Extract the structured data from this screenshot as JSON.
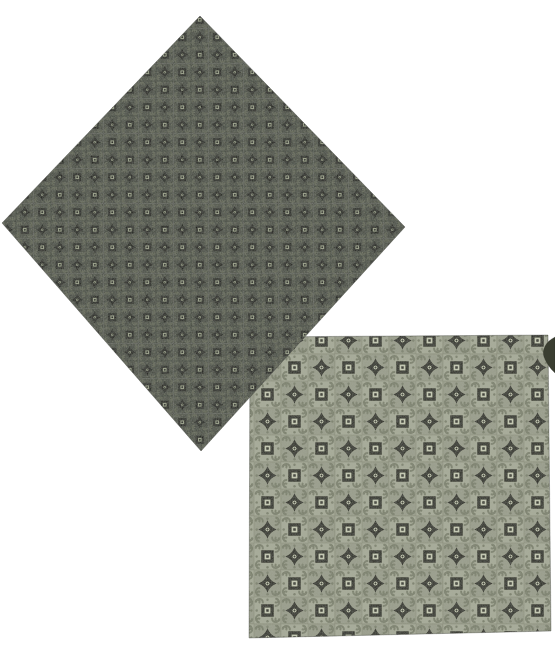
{
  "scene": {
    "description": "Photograph of two printed foulard quilting-fabric swatches on a plain white background",
    "background_color": "#ffffff",
    "motif_names": [
      "square-ring-motif",
      "four-point-star-motif",
      "corner-scroll-spirals",
      "tile-grid-lines"
    ]
  },
  "swatches": {
    "dark_diamond": {
      "label": "dark green foulard swatch rotated 45 degrees (diamond orientation), upper left",
      "shape": "diamond",
      "palette": {
        "bg": "#4b4f45",
        "bg_alt": "#464a41",
        "scroll": "#606454",
        "motif": "#15160f",
        "motif_bright": "#9aa089",
        "grid": "#383c31"
      },
      "pattern": {
        "tile_px": 17.5,
        "phase_x": 16,
        "phase_y": 11
      }
    },
    "light_square": {
      "label": "light sage-green foulard swatch, square orientation, lower right",
      "shape": "square",
      "palette": {
        "bg": "#a6aa97",
        "bg_alt": "#999d8b",
        "scroll": "#7b806c",
        "motif": "#26271d",
        "motif_bright": "#c6cab4",
        "grid": "#838874"
      },
      "pattern": {
        "tile_px": 27,
        "phase_x": 38,
        "phase_y": 3
      }
    },
    "corner_fragment": {
      "label": "small dark fabric corner peeking in at the right edge",
      "color": "#3a3e31"
    }
  }
}
